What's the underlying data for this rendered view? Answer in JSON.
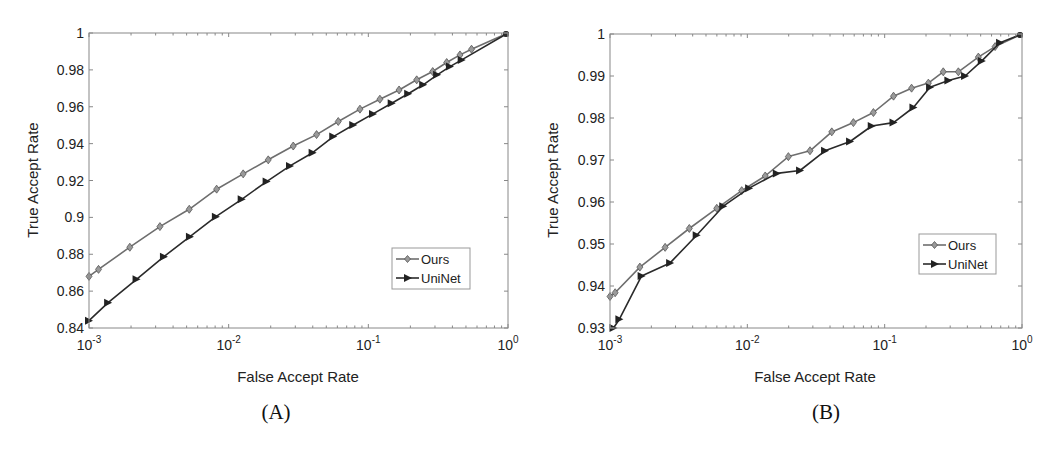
{
  "figure": {
    "panels": [
      {
        "caption": "(A)",
        "xlabel": "False Accept Rate",
        "ylabel": "True Accept Rate",
        "legend": [
          "Ours",
          "UniNet"
        ]
      },
      {
        "caption": "(B)",
        "xlabel": "False Accept Rate",
        "ylabel": "True Accept Rate",
        "legend": [
          "Ours",
          "UniNet"
        ]
      }
    ]
  },
  "colors": {
    "ours": "#6e6e6e",
    "uninet": "#2a2a2a",
    "axis": "#888888"
  },
  "chart_data": [
    {
      "type": "line",
      "title": "(A)",
      "xlabel": "False Accept Rate",
      "ylabel": "True Accept Rate",
      "xscale": "log",
      "xlim": [
        0.001,
        1
      ],
      "ylim": [
        0.84,
        1.0
      ],
      "xticks": [
        0.001,
        0.01,
        0.1,
        1
      ],
      "xtick_labels": [
        "10^-3",
        "10^-2",
        "10^-1",
        "10^0"
      ],
      "yticks": [
        0.84,
        0.86,
        0.88,
        0.9,
        0.92,
        0.94,
        0.96,
        0.98,
        1
      ],
      "ytick_labels": [
        "0.84",
        "0.86",
        "0.88",
        "0.9",
        "0.92",
        "0.94",
        "0.96",
        "0.98",
        "1"
      ],
      "grid": false,
      "legend_position": "lower right",
      "series": [
        {
          "name": "Ours",
          "marker": "diamond",
          "x": [
            0.001,
            0.00117,
            0.00196,
            0.00322,
            0.00522,
            0.0082,
            0.0127,
            0.0192,
            0.029,
            0.0426,
            0.0609,
            0.0871,
            0.121,
            0.166,
            0.222,
            0.289,
            0.364,
            0.453,
            0.548,
            1.0
          ],
          "y": [
            0.868,
            0.8718,
            0.8838,
            0.895,
            0.9044,
            0.9153,
            0.9236,
            0.9312,
            0.9387,
            0.9449,
            0.952,
            0.9587,
            0.9641,
            0.9691,
            0.9746,
            0.9791,
            0.984,
            0.9881,
            0.9912,
            1.0
          ]
        },
        {
          "name": "UniNet",
          "marker": "triangle-right",
          "x": [
            0.001,
            0.00137,
            0.00219,
            0.00344,
            0.00528,
            0.0081,
            0.0124,
            0.0187,
            0.0275,
            0.0399,
            0.0561,
            0.078,
            0.108,
            0.147,
            0.193,
            0.247,
            0.311,
            0.384,
            0.466,
            1.0
          ],
          "y": [
            0.844,
            0.8537,
            0.8664,
            0.8787,
            0.8895,
            0.9004,
            0.9098,
            0.9194,
            0.9279,
            0.9351,
            0.9438,
            0.9501,
            0.9561,
            0.9619,
            0.967,
            0.9719,
            0.9773,
            0.9818,
            0.9854,
            1.0
          ]
        }
      ]
    },
    {
      "type": "line",
      "title": "(B)",
      "xlabel": "False Accept Rate",
      "ylabel": "True Accept Rate",
      "xscale": "log",
      "xlim": [
        0.001,
        1
      ],
      "ylim": [
        0.93,
        1.0
      ],
      "xticks": [
        0.001,
        0.01,
        0.1,
        1
      ],
      "xtick_labels": [
        "10^-3",
        "10^-2",
        "10^-1",
        "10^0"
      ],
      "yticks": [
        0.93,
        0.94,
        0.95,
        0.96,
        0.97,
        0.98,
        0.99,
        1
      ],
      "ytick_labels": [
        "0.93",
        "0.94",
        "0.95",
        "0.96",
        "0.97",
        "0.98",
        "0.99",
        "1"
      ],
      "grid": false,
      "legend_position": "lower right",
      "series": [
        {
          "name": "Ours",
          "marker": "diamond",
          "x": [
            0.001,
            0.00109,
            0.00165,
            0.00252,
            0.00378,
            0.00599,
            0.0091,
            0.0135,
            0.0199,
            0.0286,
            0.0412,
            0.0592,
            0.0828,
            0.116,
            0.157,
            0.208,
            0.267,
            0.344,
            0.481,
            0.637,
            1.0
          ],
          "y": [
            0.9375,
            0.9384,
            0.9445,
            0.9492,
            0.9537,
            0.9585,
            0.9627,
            0.9662,
            0.9708,
            0.9722,
            0.9767,
            0.9789,
            0.9813,
            0.9852,
            0.9871,
            0.9883,
            0.991,
            0.991,
            0.9945,
            0.997,
            1.0
          ]
        },
        {
          "name": "UniNet",
          "marker": "triangle-right",
          "x": [
            0.00106,
            0.00117,
            0.0017,
            0.00274,
            0.00428,
            0.00668,
            0.0103,
            0.0164,
            0.0242,
            0.0368,
            0.056,
            0.0805,
            0.116,
            0.162,
            0.214,
            0.291,
            0.385,
            0.51,
            0.692,
            1.0
          ],
          "y": [
            0.93,
            0.9321,
            0.9424,
            0.9455,
            0.9521,
            0.959,
            0.9633,
            0.9668,
            0.9675,
            0.9722,
            0.9744,
            0.9781,
            0.9789,
            0.9825,
            0.9873,
            0.9889,
            0.99,
            0.9936,
            0.9979,
            1.0
          ]
        }
      ]
    }
  ]
}
